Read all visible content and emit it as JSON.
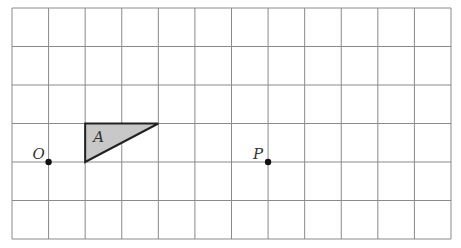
{
  "grid": {
    "cols": 12,
    "rows": 6,
    "left": 12,
    "top": 8,
    "right": 451,
    "bottom": 239,
    "line_color": "#8a8a8a"
  },
  "shape": {
    "label": "A",
    "fill": "#c8c8c8",
    "stroke": "#222222"
  },
  "points": [
    {
      "label": "O",
      "gx": 1,
      "gy": 4
    },
    {
      "label": "P",
      "gx": 7,
      "gy": 4
    }
  ]
}
